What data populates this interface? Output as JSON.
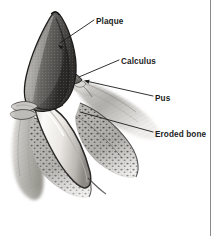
{
  "figure": {
    "title": "Periodontal disease cross-section",
    "background_color": "#ffffff",
    "ink_color": "#1b1b1b",
    "rule_color": "#8a8a8a"
  },
  "labels": [
    {
      "id": "plaque",
      "text": "Plaque",
      "text_x": 96,
      "text_y": 22,
      "leader": "M 94 20 L 60 43",
      "arrow": true,
      "arrow_x": 58,
      "arrow_y": 45,
      "arrow_angle": 214
    },
    {
      "id": "calculus",
      "text": "Calculus",
      "text_x": 121,
      "text_y": 62,
      "leader": "M 119 60 L 79 77",
      "arrow": false,
      "arrow_x": 0,
      "arrow_y": 0,
      "arrow_angle": 0
    },
    {
      "id": "pus",
      "text": "Pus",
      "text_x": 155,
      "text_y": 99,
      "leader": "M 153 96 L 86 81",
      "arrow": true,
      "arrow_x": 84,
      "arrow_y": 80.6,
      "arrow_angle": 192
    },
    {
      "id": "eroded-bone",
      "text": "Eroded bone",
      "text_x": 155,
      "text_y": 135,
      "leader": "M 153 132 L 80 112",
      "arrow": false,
      "arrow_x": 0,
      "arrow_y": 0,
      "arrow_angle": 0
    }
  ],
  "anatomy": {
    "crown": {
      "name": "tooth-crown-with-plaque",
      "fill": "#5d5d5d",
      "shade": "#3a3a3a",
      "highlight": "#9a9a9a"
    },
    "root": {
      "name": "tooth-root",
      "fill": "#f3f1ee",
      "outline": "#2a2a2a",
      "shadow": "#c6c4c0"
    },
    "calculus_deposit": {
      "name": "calculus-deposit",
      "fill": "#6e6c68"
    },
    "gum": {
      "name": "gum-tissue",
      "fill": "#bdbbb7",
      "shade": "#8d8b87"
    },
    "bone": {
      "name": "eroded-alveolar-bone",
      "fill": "#a9a7a3",
      "stipple": "#2e2e2e"
    },
    "pocket": {
      "name": "periodontal-pocket-pus",
      "fill": "#d8d6d2"
    }
  },
  "frame": {
    "right_rule_x": 210,
    "right_rule_top": 0,
    "right_rule_bottom": 236
  }
}
